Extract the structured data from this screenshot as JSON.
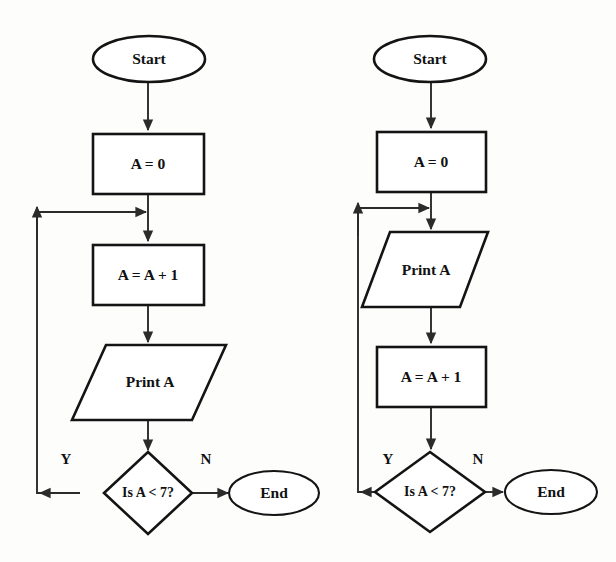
{
  "page": {
    "background_color": "#fdfdfc",
    "ink_color": "#141414",
    "connector_color": "#2b2b2b"
  },
  "diagrams": [
    {
      "id": "left-flowchart",
      "name": "increment-then-print",
      "nodes": [
        {
          "id": "start",
          "shape": "ellipse",
          "label": "Start"
        },
        {
          "id": "init",
          "shape": "rectangle",
          "label": "A = 0"
        },
        {
          "id": "increment",
          "shape": "rectangle",
          "label": "A = A + 1"
        },
        {
          "id": "print",
          "shape": "parallelogram",
          "label": "Print A"
        },
        {
          "id": "decision",
          "shape": "diamond",
          "label": "Is A < 7?"
        },
        {
          "id": "end",
          "shape": "ellipse",
          "label": "End"
        }
      ],
      "edges": [
        {
          "from": "start",
          "to": "init",
          "label": ""
        },
        {
          "from": "init",
          "to": "increment",
          "label": ""
        },
        {
          "from": "increment",
          "to": "print",
          "label": ""
        },
        {
          "from": "print",
          "to": "decision",
          "label": ""
        },
        {
          "from": "decision",
          "to": "increment",
          "label": "Y"
        },
        {
          "from": "decision",
          "to": "end",
          "label": "N"
        }
      ],
      "branch_labels": {
        "yes": "Y",
        "no": "N"
      }
    },
    {
      "id": "right-flowchart",
      "name": "print-then-increment",
      "nodes": [
        {
          "id": "start",
          "shape": "ellipse",
          "label": "Start"
        },
        {
          "id": "init",
          "shape": "rectangle",
          "label": "A = 0"
        },
        {
          "id": "print",
          "shape": "parallelogram",
          "label": "Print A"
        },
        {
          "id": "increment",
          "shape": "rectangle",
          "label": "A = A + 1"
        },
        {
          "id": "decision",
          "shape": "diamond",
          "label": "Is A < 7?"
        },
        {
          "id": "end",
          "shape": "ellipse",
          "label": "End"
        }
      ],
      "edges": [
        {
          "from": "start",
          "to": "init",
          "label": ""
        },
        {
          "from": "init",
          "to": "print",
          "label": ""
        },
        {
          "from": "print",
          "to": "increment",
          "label": ""
        },
        {
          "from": "increment",
          "to": "decision",
          "label": ""
        },
        {
          "from": "decision",
          "to": "print",
          "label": "Y"
        },
        {
          "from": "decision",
          "to": "end",
          "label": "N"
        }
      ],
      "branch_labels": {
        "yes": "Y",
        "no": "N"
      }
    }
  ]
}
